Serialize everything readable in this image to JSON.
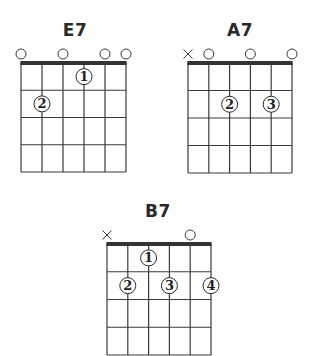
{
  "colors": {
    "line": "#3a3a3a",
    "nut": "#333333",
    "finger_fill": "#ffffff",
    "finger_stroke": "#2a2a2a",
    "text": "#222222"
  },
  "chords": [
    {
      "name": "E7",
      "strings": 6,
      "frets": 4,
      "string_markers": [
        "open",
        "none",
        "open",
        "none",
        "open",
        "open"
      ],
      "fingerings": [
        {
          "string": 4,
          "fret": 1,
          "finger": "1"
        },
        {
          "string": 2,
          "fret": 2,
          "finger": "2"
        }
      ]
    },
    {
      "name": "A7",
      "strings": 6,
      "frets": 4,
      "string_markers": [
        "muted",
        "open",
        "none",
        "open",
        "none",
        "open"
      ],
      "fingerings": [
        {
          "string": 3,
          "fret": 2,
          "finger": "2"
        },
        {
          "string": 5,
          "fret": 2,
          "finger": "3"
        }
      ]
    },
    {
      "name": "B7",
      "strings": 6,
      "frets": 4,
      "string_markers": [
        "muted",
        "none",
        "none",
        "none",
        "open",
        "none"
      ],
      "fingerings": [
        {
          "string": 3,
          "fret": 1,
          "finger": "1"
        },
        {
          "string": 2,
          "fret": 2,
          "finger": "2"
        },
        {
          "string": 4,
          "fret": 2,
          "finger": "3"
        },
        {
          "string": 6,
          "fret": 2,
          "finger": "4"
        }
      ]
    }
  ]
}
